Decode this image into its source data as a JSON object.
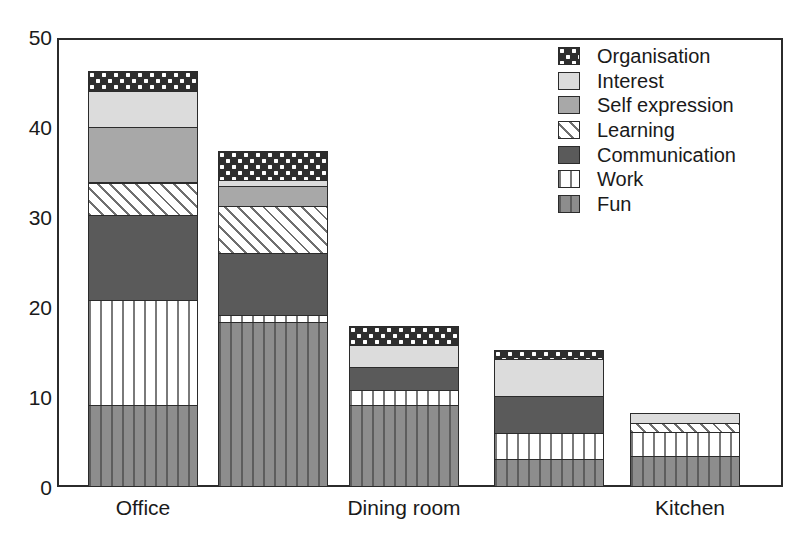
{
  "chart_data": {
    "type": "bar",
    "stacked": true,
    "title": "",
    "xlabel": "",
    "ylabel": "",
    "ylim": [
      0,
      50
    ],
    "y_ticks": [
      0,
      10,
      20,
      30,
      40,
      50
    ],
    "y_minor_ticks": [
      5,
      15,
      25,
      35,
      45
    ],
    "grid": false,
    "legend_position": "top-right",
    "categories": [
      "Office",
      "",
      "Dining room",
      "",
      "Kitchen"
    ],
    "tick_labels_visible": [
      "Office",
      "Dining room",
      "Kitchen"
    ],
    "series": [
      {
        "name": "Fun",
        "values": [
          9.0,
          18.3,
          9.0,
          3.0,
          3.3
        ]
      },
      {
        "name": "Work",
        "values": [
          11.7,
          0.7,
          1.7,
          2.9,
          2.7
        ]
      },
      {
        "name": "Communication",
        "values": [
          9.5,
          6.9,
          2.5,
          4.1,
          0.0
        ]
      },
      {
        "name": "Learning",
        "values": [
          3.6,
          5.3,
          0.0,
          0.0,
          1.0
        ]
      },
      {
        "name": "Self expression",
        "values": [
          6.2,
          2.2,
          0.0,
          0.0,
          0.0
        ]
      },
      {
        "name": "Interest",
        "values": [
          4.0,
          0.7,
          2.5,
          4.1,
          1.1
        ]
      },
      {
        "name": "Organisation",
        "values": [
          2.2,
          3.2,
          2.1,
          1.1,
          0.0
        ]
      }
    ],
    "totals": [
      46.2,
      37.3,
      18.3,
      15.2,
      8.1
    ]
  },
  "legend": {
    "items": [
      {
        "label": "Organisation",
        "pattern": "checkerboard",
        "color": "#2e2e2e"
      },
      {
        "label": "Interest",
        "pattern": "solid-light",
        "color": "#dcdcdc"
      },
      {
        "label": "Self expression",
        "pattern": "solid-mid",
        "color": "#a8a8a8"
      },
      {
        "label": "Learning",
        "pattern": "diagonal-hatch",
        "color": "#fbfbfb"
      },
      {
        "label": "Communication",
        "pattern": "solid-dark",
        "color": "#5a5a5a"
      },
      {
        "label": "Work",
        "pattern": "vertical-light",
        "color": "#ffffff"
      },
      {
        "label": "Fun",
        "pattern": "vertical-dark",
        "color": "#8d8d8d"
      }
    ]
  },
  "y_axis": {
    "labels": [
      "50",
      "40",
      "30",
      "20",
      "10",
      "0"
    ]
  },
  "x_axis": {
    "labels": [
      "Office",
      "Dining room",
      "Kitchen"
    ]
  }
}
